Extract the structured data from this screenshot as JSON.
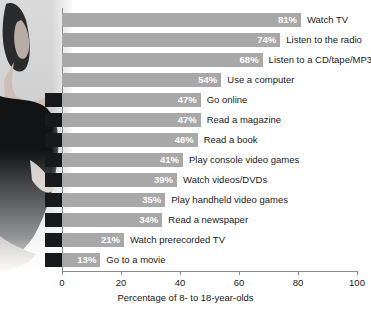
{
  "chart_data": {
    "type": "bar",
    "orientation": "horizontal",
    "title": "",
    "xlabel": "Percentage of 8- to 18-year-olds",
    "ylabel": "",
    "xlim": [
      0,
      100
    ],
    "xticks": [
      0,
      20,
      40,
      60,
      80,
      100
    ],
    "grid": false,
    "legend": null,
    "categories": [
      "Watch TV",
      "Listen to the radio",
      "Listen to a CD/tape/MP3",
      "Use a computer",
      "Go online",
      "Read a magazine",
      "Read a book",
      "Play console video games",
      "Watch videos/DVDs",
      "Play handheld video games",
      "Read a newspaper",
      "Watch prerecorded TV",
      "Go to a movie"
    ],
    "values": [
      81,
      74,
      68,
      54,
      47,
      47,
      46,
      41,
      39,
      35,
      34,
      21,
      13
    ],
    "value_labels": [
      "81%",
      "74%",
      "68%",
      "54%",
      "47%",
      "47%",
      "46%",
      "41%",
      "39%",
      "35%",
      "34%",
      "21%",
      "13%"
    ]
  },
  "axis": {
    "x_title": "Percentage of 8- to 18-year-olds",
    "tick_labels": [
      "0",
      "20",
      "40",
      "60",
      "80",
      "100"
    ]
  },
  "colors": {
    "bar": "#a8a8a8",
    "bar_stub": "#17191a",
    "value_text": "#ffffff",
    "label_text": "#1a1a1a",
    "axis": "#8a8a8a",
    "background": "#ffffff"
  }
}
